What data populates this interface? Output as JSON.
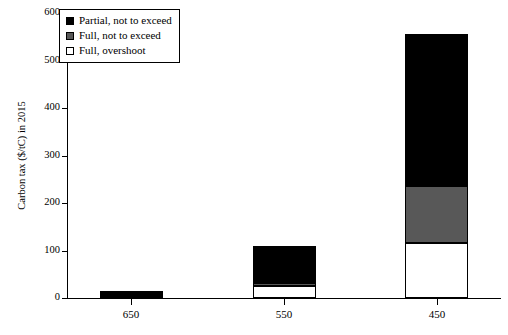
{
  "chart_data": {
    "type": "bar",
    "title": "",
    "subtitle": "",
    "xlabel": "",
    "ylabel": "Carbon tax ($/tC) in 2015",
    "categories": [
      "650",
      "550",
      "450"
    ],
    "ylim": [
      0,
      600
    ],
    "yticks": [
      0,
      100,
      200,
      300,
      400,
      500,
      600
    ],
    "grid": false,
    "stacked": true,
    "stack_order_bottom_to_top": [
      "Full, overshoot",
      "Full, not to exceed",
      "Partial, not to exceed"
    ],
    "legend_position": "upper-left",
    "series": [
      {
        "name": "Partial, not to exceed",
        "color": "#000000",
        "values": [
          12,
          78,
          320
        ]
      },
      {
        "name": "Full, not to exceed",
        "color": "#585858",
        "values": [
          3,
          7,
          120
        ]
      },
      {
        "name": "Full, overshoot",
        "color": "#ffffff",
        "values": [
          0,
          25,
          115
        ]
      }
    ],
    "totals": [
      15,
      110,
      555
    ],
    "annotations": []
  },
  "axes": {
    "y_tick_labels": [
      "600",
      "500",
      "400",
      "300",
      "200",
      "100",
      "0"
    ],
    "x_tick_labels": [
      "650",
      "550",
      "450"
    ],
    "y_title": "Carbon tax ($/tC) in 2015"
  },
  "legend": {
    "items": [
      {
        "label": "Partial, not to exceed",
        "swatch": "black-swatch"
      },
      {
        "label": "Full, not to exceed",
        "swatch": "gray-swatch"
      },
      {
        "label": "Full, overshoot",
        "swatch": "white-swatch"
      }
    ]
  }
}
